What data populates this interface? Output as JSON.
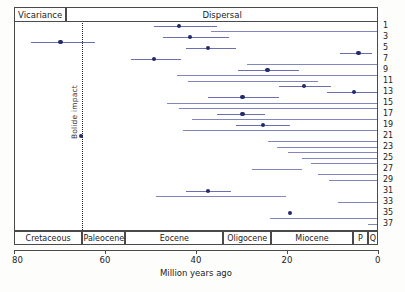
{
  "figure": {
    "xlabel": "Million years ago",
    "mode_headers": [
      {
        "label": "Vicariance",
        "x_start_ma": 80,
        "x_end_ma": 68.5
      },
      {
        "label": "Dispersal",
        "x_start_ma": 68.5,
        "x_end_ma": 0
      }
    ],
    "bolide": {
      "label": "Bolide impact",
      "age_ma": 65
    }
  },
  "chart_data": {
    "type": "range-bar",
    "title": "",
    "xlabel": "Million years ago",
    "ylabel": "",
    "xlim": [
      80,
      0
    ],
    "x_ticks": [
      80,
      60,
      40,
      20,
      0
    ],
    "x_tick_labels": [
      "80",
      "60",
      "40",
      "20",
      "0"
    ],
    "grid": false,
    "legend": "none",
    "axis_direction": "reversed",
    "annotations": [
      {
        "name": "bolide-impact",
        "type": "vline",
        "x": 65,
        "style": "dotted",
        "label": "Bolide impact"
      },
      {
        "name": "vicariance-dispersal-divider",
        "type": "header-split",
        "x": 68.5
      }
    ],
    "epochs": [
      {
        "name": "Cretaceous",
        "start_ma": 80,
        "end_ma": 65
      },
      {
        "name": "Paleocene",
        "start_ma": 65,
        "end_ma": 55.5
      },
      {
        "name": "Eocene",
        "start_ma": 55.5,
        "end_ma": 34
      },
      {
        "name": "Oligocene",
        "start_ma": 34,
        "end_ma": 23.5
      },
      {
        "name": "Miocene",
        "start_ma": 23.5,
        "end_ma": 5.5
      },
      {
        "name": "P",
        "start_ma": 5.5,
        "end_ma": 2.2
      },
      {
        "name": "Q",
        "start_ma": 2.2,
        "end_ma": 0
      }
    ],
    "row_labels": [
      "1",
      "3",
      "5",
      "7",
      "9",
      "11",
      "13",
      "15",
      "17",
      "19",
      "21",
      "23",
      "25",
      "27",
      "29",
      "31",
      "33",
      "35",
      "37"
    ],
    "ylabel_note": "odd-numbered node labels, 1-37",
    "rows": [
      {
        "id": 1,
        "low": 49.5,
        "high": 35.5,
        "estimate": 44.0
      },
      {
        "id": 2,
        "low": 37.0,
        "high": 0.0,
        "estimate": null
      },
      {
        "id": 3,
        "low": 47.5,
        "high": 33.0,
        "estimate": 41.5
      },
      {
        "id": 4,
        "low": 76.5,
        "high": 62.5,
        "estimate": 70.0
      },
      {
        "id": 5,
        "low": 42.5,
        "high": 31.5,
        "estimate": 37.5
      },
      {
        "id": 6,
        "low": 8.5,
        "high": 1.5,
        "estimate": 4.5
      },
      {
        "id": 7,
        "low": 54.5,
        "high": 43.5,
        "estimate": 49.5
      },
      {
        "id": 8,
        "low": 29.0,
        "high": 0.0,
        "estimate": null
      },
      {
        "id": 9,
        "low": 31.0,
        "high": 17.5,
        "estimate": 24.5
      },
      {
        "id": 10,
        "low": 44.5,
        "high": 0.0,
        "estimate": null
      },
      {
        "id": 11,
        "low": 42.0,
        "high": 13.5,
        "estimate": null
      },
      {
        "id": 12,
        "low": 22.0,
        "high": 10.5,
        "estimate": 16.5
      },
      {
        "id": 13,
        "low": 11.5,
        "high": 0.5,
        "estimate": 5.5
      },
      {
        "id": 14,
        "low": 37.5,
        "high": 22.0,
        "estimate": 30.0
      },
      {
        "id": 15,
        "low": 46.5,
        "high": 0.0,
        "estimate": null
      },
      {
        "id": 16,
        "low": 44.0,
        "high": 0.0,
        "estimate": null
      },
      {
        "id": 17,
        "low": 35.5,
        "high": 25.0,
        "estimate": 30.0
      },
      {
        "id": 18,
        "low": 41.0,
        "high": 0.0,
        "estimate": null
      },
      {
        "id": 19,
        "low": 31.5,
        "high": 19.5,
        "estimate": 25.5
      },
      {
        "id": 20,
        "low": 43.0,
        "high": 0.0,
        "estimate": null
      },
      {
        "id": 21,
        "low": 65.5,
        "high": 65.5,
        "estimate": 65.5
      },
      {
        "id": 22,
        "low": 24.5,
        "high": 0.0,
        "estimate": null
      },
      {
        "id": 23,
        "low": 22.5,
        "high": 0.0,
        "estimate": null
      },
      {
        "id": 24,
        "low": 20.0,
        "high": 0.0,
        "estimate": null
      },
      {
        "id": 25,
        "low": 17.0,
        "high": 0.0,
        "estimate": null
      },
      {
        "id": 26,
        "low": 15.0,
        "high": 0.0,
        "estimate": null
      },
      {
        "id": 27,
        "low": 28.0,
        "high": 17.0,
        "estimate": null
      },
      {
        "id": 28,
        "low": 13.5,
        "high": 0.0,
        "estimate": null
      },
      {
        "id": 29,
        "low": 11.0,
        "high": 0.0,
        "estimate": null
      },
      {
        "id": 31,
        "low": 42.5,
        "high": 32.5,
        "estimate": 37.5
      },
      {
        "id": 32,
        "low": 49.0,
        "high": 20.5,
        "estimate": null
      },
      {
        "id": 33,
        "low": 9.0,
        "high": 0.0,
        "estimate": null
      },
      {
        "id": 35,
        "low": 19.5,
        "high": 19.5,
        "estimate": 19.5
      },
      {
        "id": 36,
        "low": 24.0,
        "high": 0.0,
        "estimate": null
      },
      {
        "id": 37,
        "low": 2.5,
        "high": 0.0,
        "estimate": null
      }
    ]
  }
}
